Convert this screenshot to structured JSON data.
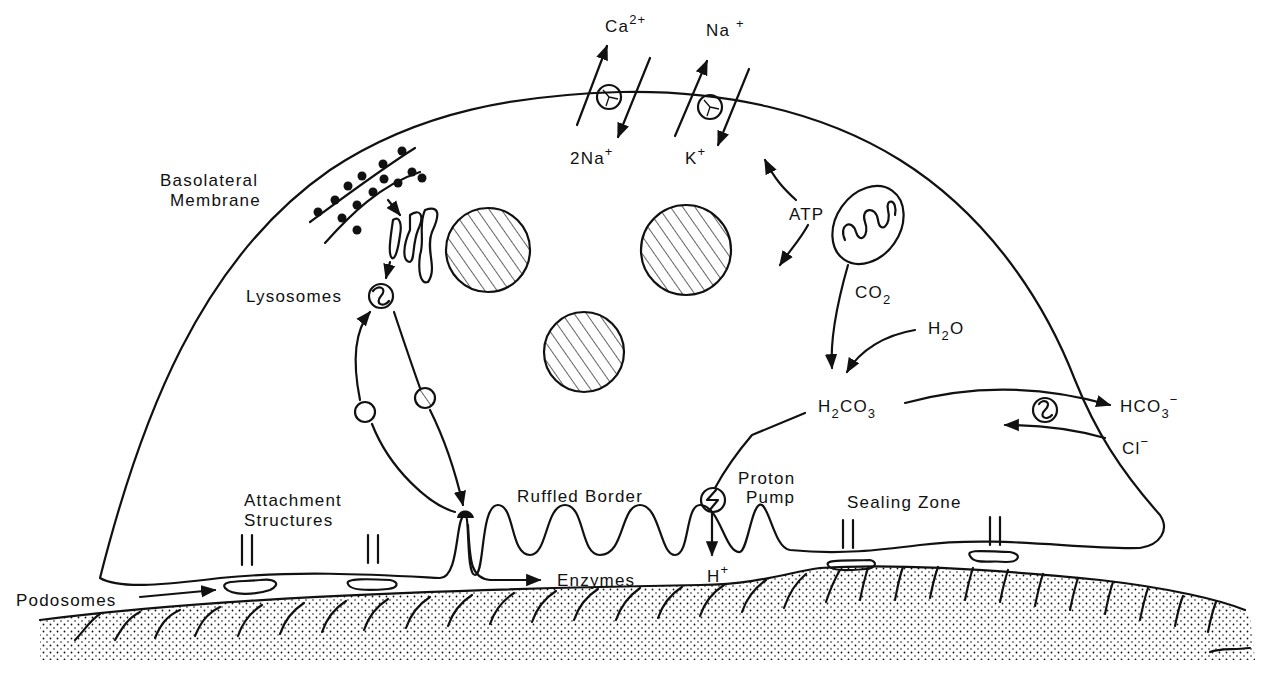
{
  "diagram": {
    "background_color": "#ffffff",
    "ink_color": "#111111",
    "labels": {
      "ca": {
        "base": "Ca",
        "sup": "2+"
      },
      "na_out": {
        "base": "Na",
        "sup": "+"
      },
      "two_na": {
        "base": "2Na",
        "sup": "+"
      },
      "k": {
        "base": "K",
        "sup": "+"
      },
      "basolateral_line1": "Basolateral",
      "basolateral_line2": "Membrane",
      "lysosomes": "Lysosomes",
      "atp": "ATP",
      "co2": {
        "base": "CO",
        "sub": "2"
      },
      "h2o": {
        "h": "H",
        "sub": "2",
        "o": "O"
      },
      "h2co3": {
        "h": "H",
        "sub1": "2",
        "co": "CO",
        "sub2": "3"
      },
      "hco3": {
        "base": "HCO",
        "sub": "3",
        "sup": "−"
      },
      "cl": {
        "base": "Cl",
        "sup": "−"
      },
      "proton_line1": "Proton",
      "proton_line2": "Pump",
      "ruffled_border": "Ruffled Border",
      "attachment_line1": "Attachment",
      "attachment_line2": "Structures",
      "sealing_zone": "Sealing Zone",
      "podosomes": "Podosomes",
      "enzymes": "Enzymes",
      "h_plus": {
        "base": "H",
        "sup": "+"
      }
    },
    "components": [
      "cell-membrane",
      "ca-na-exchanger",
      "na-k-pump",
      "rough-er",
      "golgi",
      "nuclei",
      "lysosome",
      "vesicles",
      "mitochondrion",
      "hco3-cl-exchanger",
      "proton-pump",
      "ruffled-border",
      "podosomes",
      "sealing-zone",
      "bone-matrix"
    ]
  }
}
